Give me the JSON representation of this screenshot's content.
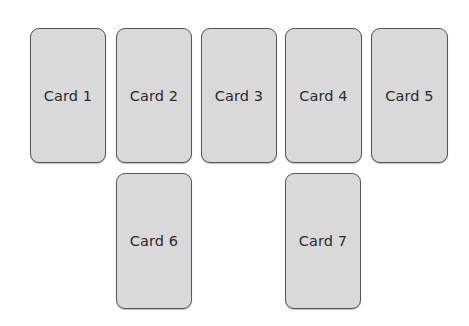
{
  "cards": [
    {
      "label": "Card 1"
    },
    {
      "label": "Card 2"
    },
    {
      "label": "Card 3"
    },
    {
      "label": "Card 4"
    },
    {
      "label": "Card 5"
    },
    {
      "label": "Card 6"
    },
    {
      "label": "Card 7"
    }
  ],
  "colors": {
    "card_fill": "#d9d9d9",
    "card_border": "#555555",
    "text": "#2b2b2b",
    "background": "#ffffff"
  }
}
